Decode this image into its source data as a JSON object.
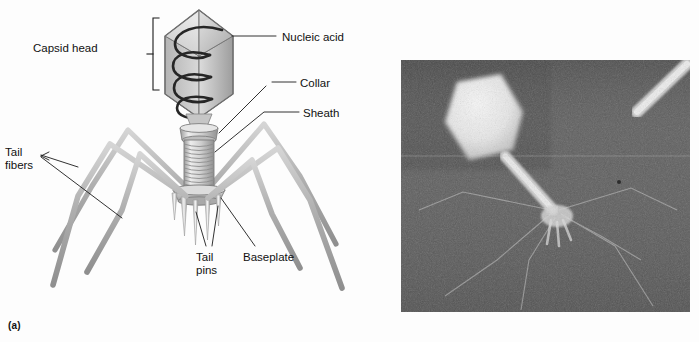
{
  "figure": {
    "type": "scientific-figure",
    "background_color": "#fdfdfd",
    "panels": [
      {
        "id": "a",
        "caption": "(a)",
        "kind": "labeled-diagram",
        "description": "Three-dimensional shaded illustration of a tailed bacteriophage virion with leader-line labels"
      },
      {
        "id": "b",
        "caption": "(b)",
        "kind": "electron-micrograph",
        "description": "Grayscale transmission electron micrograph of a negatively stained bacteriophage with a bright polyhedral head, contractile tail and splayed tail fibers; a second partial phage tail appears at upper right"
      }
    ]
  },
  "diagram": {
    "labels": [
      {
        "id": "capsid-head",
        "text": "Capsid head",
        "x": 33,
        "y": 42,
        "align": "left"
      },
      {
        "id": "nucleic-acid",
        "text": "Nucleic acid",
        "x": 282,
        "y": 31,
        "align": "left"
      },
      {
        "id": "collar",
        "text": "Collar",
        "x": 300,
        "y": 77,
        "align": "left"
      },
      {
        "id": "sheath",
        "text": "Sheath",
        "x": 303,
        "y": 107,
        "align": "left"
      },
      {
        "id": "tail-fibers",
        "text": "Tail\nfibers",
        "x": 5,
        "y": 146,
        "align": "left"
      },
      {
        "id": "tail-pins",
        "text": "Tail\npins",
        "x": 196,
        "y": 251,
        "align": "left"
      },
      {
        "id": "baseplate",
        "text": "Baseplate",
        "x": 243,
        "y": 251,
        "align": "left"
      }
    ],
    "parts": [
      "capsid head",
      "nucleic acid",
      "collar",
      "sheath",
      "baseplate",
      "tail pins",
      "tail fibers"
    ],
    "colors": {
      "body_light": "#e9e9e9",
      "body_mid": "#b9b9b9",
      "body_dark": "#8e8e8e",
      "outline": "#6f6f6f",
      "nucleic_acid": "#2a2a2a",
      "leader_line": "#1b1b1b",
      "label_text": "#111111"
    },
    "counts": {
      "tail_fibers": 6,
      "tail_pins": 6,
      "nucleic_acid_coils": 4,
      "sheath_rings": 12
    }
  },
  "micrograph": {
    "frame": {
      "x": 11,
      "y": 60,
      "width": 289,
      "height": 252
    },
    "colors": {
      "background": "#6f6f6f",
      "grain_dark": "#4a4a4a",
      "grain_light": "#8b8b8b",
      "specimen_bright": "#f2f2f2",
      "specimen_mid": "#cfcfcf"
    },
    "features": [
      "bright polyhedral capsid head (upper left)",
      "straight extended tail sheath",
      "baseplate with splayed tail fibers (lower center)",
      "second partial phage tail at upper right corner",
      "faint horizontal scan line across upper third"
    ]
  }
}
